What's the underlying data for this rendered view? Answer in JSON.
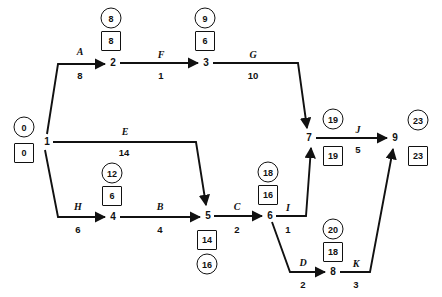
{
  "diagram": {
    "type": "activity-on-arrow-network",
    "legend": {
      "circle_meaning": "earliest event time",
      "square_meaning": "latest event time"
    },
    "nodes": [
      {
        "id": "1",
        "label": "1",
        "x": 47,
        "y": 142,
        "circle": "0",
        "square": "0",
        "circle_x": 24,
        "circle_y": 127,
        "square_x": 24,
        "square_y": 153
      },
      {
        "id": "2",
        "label": "2",
        "x": 113,
        "y": 63,
        "circle": "8",
        "square": "8",
        "circle_x": 111,
        "circle_y": 18,
        "square_x": 111,
        "square_y": 41
      },
      {
        "id": "3",
        "label": "3",
        "x": 206,
        "y": 63,
        "circle": "9",
        "square": "6",
        "circle_x": 205,
        "circle_y": 18,
        "square_x": 205,
        "square_y": 41
      },
      {
        "id": "4",
        "label": "4",
        "x": 113,
        "y": 217,
        "circle": "12",
        "square": "6",
        "circle_x": 112,
        "circle_y": 173,
        "square_x": 112,
        "square_y": 196
      },
      {
        "id": "5",
        "label": "5",
        "x": 208,
        "y": 216,
        "circle": "16",
        "square": "14",
        "circle_x": 207,
        "circle_y": 264,
        "square_x": 207,
        "square_y": 240
      },
      {
        "id": "6",
        "label": "6",
        "x": 270,
        "y": 216,
        "circle": "18",
        "square": "16",
        "circle_x": 268,
        "circle_y": 172,
        "square_x": 268,
        "square_y": 195
      },
      {
        "id": "7",
        "label": "7",
        "x": 309,
        "y": 138,
        "circle": "19",
        "square": "19",
        "circle_x": 333,
        "circle_y": 119,
        "square_x": 333,
        "square_y": 156
      },
      {
        "id": "8",
        "label": "8",
        "x": 333,
        "y": 272,
        "circle": "20",
        "square": "18",
        "circle_x": 333,
        "circle_y": 229,
        "square_x": 333,
        "square_y": 252
      },
      {
        "id": "9",
        "label": "9",
        "x": 395,
        "y": 138,
        "circle": "23",
        "square": "23",
        "circle_x": 418,
        "circle_y": 120,
        "square_x": 418,
        "square_y": 156
      }
    ],
    "edges": [
      {
        "id": "A",
        "name": "A",
        "duration": "8",
        "from": "1",
        "to": "2",
        "name_x": 80,
        "name_y": 52,
        "dur_x": 80,
        "dur_y": 76
      },
      {
        "id": "F",
        "name": "F",
        "duration": "1",
        "from": "2",
        "to": "3",
        "name_x": 161,
        "name_y": 55,
        "dur_x": 161,
        "dur_y": 76
      },
      {
        "id": "G",
        "name": "G",
        "duration": "10",
        "from": "3",
        "to": "7",
        "name_x": 253,
        "name_y": 55,
        "dur_x": 253,
        "dur_y": 76
      },
      {
        "id": "E",
        "name": "E",
        "duration": "14",
        "from": "1",
        "to": "5",
        "name_x": 125,
        "name_y": 132,
        "dur_x": 124,
        "dur_y": 153
      },
      {
        "id": "H",
        "name": "H",
        "duration": "6",
        "from": "1",
        "to": "4",
        "name_x": 78,
        "name_y": 207,
        "dur_x": 78,
        "dur_y": 230
      },
      {
        "id": "B",
        "name": "B",
        "duration": "4",
        "from": "4",
        "to": "5",
        "name_x": 160,
        "name_y": 207,
        "dur_x": 160,
        "dur_y": 230
      },
      {
        "id": "C",
        "name": "C",
        "duration": "2",
        "from": "5",
        "to": "6",
        "name_x": 237,
        "name_y": 207,
        "dur_x": 237,
        "dur_y": 230
      },
      {
        "id": "I",
        "name": "I",
        "duration": "1",
        "from": "6",
        "to": "7",
        "name_x": 288,
        "name_y": 208,
        "dur_x": 288,
        "dur_y": 230
      },
      {
        "id": "D",
        "name": "D",
        "duration": "2",
        "from": "6",
        "to": "8",
        "name_x": 303,
        "name_y": 263,
        "dur_x": 303,
        "dur_y": 285
      },
      {
        "id": "K",
        "name": "K",
        "duration": "3",
        "from": "8",
        "to": "9",
        "name_x": 356,
        "name_y": 264,
        "dur_x": 356,
        "dur_y": 285
      },
      {
        "id": "J",
        "name": "J",
        "duration": "5",
        "from": "7",
        "to": "9",
        "name_x": 358,
        "name_y": 130,
        "dur_x": 358,
        "dur_y": 150
      }
    ]
  },
  "colors": {
    "line": "#111111",
    "text": "#111111",
    "background": "#ffffff"
  }
}
